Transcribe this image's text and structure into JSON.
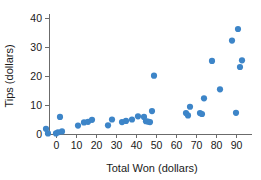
{
  "chart_data": {
    "type": "scatter",
    "title": "",
    "xlabel": "Total Won (dollars)",
    "ylabel": "Tips (dollars)",
    "xlim": [
      -8,
      97
    ],
    "ylim": [
      -2.5,
      43
    ],
    "xticks": [
      0,
      10,
      20,
      30,
      40,
      50,
      60,
      70,
      80,
      90
    ],
    "yticks": [
      0,
      10,
      20,
      30,
      40
    ],
    "xtick_labels": [
      "0",
      "10",
      "20",
      "30",
      "40",
      "50",
      "60",
      "70",
      "80",
      "90"
    ],
    "ytick_labels": [
      "0",
      "10",
      "20",
      "30",
      "40"
    ],
    "grid": false,
    "legend": false,
    "marker_color": "#3d85c8",
    "marker_size": 3.1,
    "axis_color": "#6b6b6b",
    "series": [
      {
        "name": "Tips vs Total Won",
        "points": [
          [
            -5,
            1.8
          ],
          [
            -4,
            0.2
          ],
          [
            0,
            0.2
          ],
          [
            1,
            0.6
          ],
          [
            2,
            5.9
          ],
          [
            3,
            0.9
          ],
          [
            11,
            2.9
          ],
          [
            14,
            4.0
          ],
          [
            16,
            4.2
          ],
          [
            18,
            4.9
          ],
          [
            26,
            3.0
          ],
          [
            28,
            5.0
          ],
          [
            33,
            4.1
          ],
          [
            35,
            4.5
          ],
          [
            38,
            5.0
          ],
          [
            41,
            6.1
          ],
          [
            44,
            5.9
          ],
          [
            45,
            4.4
          ],
          [
            46,
            4.3
          ],
          [
            47,
            4.1
          ],
          [
            48,
            7.9
          ],
          [
            49,
            20.1
          ],
          [
            65,
            7.2
          ],
          [
            66,
            6.4
          ],
          [
            67,
            9.4
          ],
          [
            72,
            7.2
          ],
          [
            73,
            6.9
          ],
          [
            74,
            12.3
          ],
          [
            78,
            25.2
          ],
          [
            82,
            15.4
          ],
          [
            88,
            32.2
          ],
          [
            90,
            7.3
          ],
          [
            91,
            36.2
          ],
          [
            92,
            23.1
          ],
          [
            93,
            25.4
          ]
        ]
      }
    ]
  }
}
